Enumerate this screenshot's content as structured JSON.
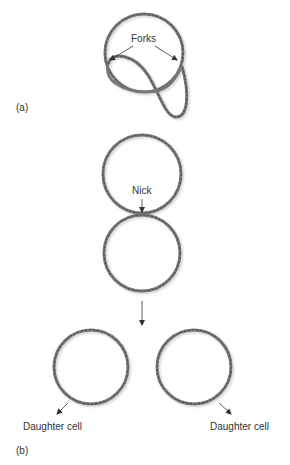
{
  "panels": {
    "a": {
      "label": "(a)",
      "annotation": "Forks"
    },
    "b": {
      "label": "(b)",
      "annotation": "Nick",
      "daughters": [
        {
          "label": "Daughter cell"
        },
        {
          "label": "Daughter cell"
        }
      ]
    }
  },
  "colors": {
    "strand": "#7a7a7a",
    "strand_dark": "#4a4a4a",
    "text": "#333333"
  }
}
